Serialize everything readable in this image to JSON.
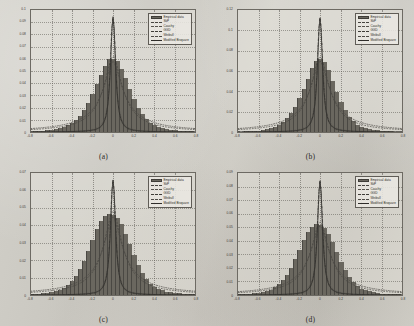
{
  "figure": {
    "background_color": "#cfcdc6",
    "panel_count": 4,
    "legend_entries": [
      {
        "label": "Empirical data",
        "style": "filled-bar",
        "color": "#6a675f"
      },
      {
        "label": "SkP",
        "style": "dashed",
        "color": "#46443f"
      },
      {
        "label": "Cauchy",
        "style": "dash-dot",
        "color": "#55524c"
      },
      {
        "label": "GGD",
        "style": "dash-dot-dot",
        "color": "#3e3c37"
      },
      {
        "label": "Weibull",
        "style": "dash-dot-dash",
        "color": "#4d4a45"
      },
      {
        "label": "Modified Bisquare",
        "style": "solid",
        "color": "#2f2d2a"
      }
    ]
  },
  "panels": [
    {
      "caption": "(a)",
      "chart_data": {
        "type": "bar",
        "title": "",
        "xlabel": "",
        "ylabel": "",
        "grid": true,
        "legend_position": "top-right",
        "xlim": [
          -0.8,
          0.8
        ],
        "ylim": [
          0,
          0.1
        ],
        "xticks": [
          "-0.8",
          "-0.6",
          "-0.4",
          "-0.2",
          "0",
          "0.2",
          "0.4",
          "0.6",
          "0.8"
        ],
        "yticks": [
          "0",
          "0.01",
          "0.02",
          "0.03",
          "0.04",
          "0.05",
          "0.06",
          "0.07",
          "0.08",
          "0.09",
          "0.1"
        ],
        "categories": [
          -0.8,
          -0.76,
          -0.72,
          -0.68,
          -0.64,
          -0.6,
          -0.56,
          -0.52,
          -0.48,
          -0.44,
          -0.4,
          -0.36,
          -0.32,
          -0.28,
          -0.24,
          -0.2,
          -0.16,
          -0.12,
          -0.08,
          -0.04,
          0.0,
          0.04,
          0.08,
          0.12,
          0.16,
          0.2,
          0.24,
          0.28,
          0.32,
          0.36,
          0.4,
          0.44,
          0.48,
          0.52,
          0.56,
          0.6,
          0.64,
          0.68,
          0.72,
          0.76,
          0.8
        ],
        "values": [
          0.0004,
          0.0006,
          0.0008,
          0.001,
          0.0013,
          0.0017,
          0.0022,
          0.003,
          0.004,
          0.0055,
          0.0075,
          0.01,
          0.0135,
          0.018,
          0.024,
          0.031,
          0.039,
          0.047,
          0.0545,
          0.0595,
          0.06,
          0.058,
          0.052,
          0.044,
          0.035,
          0.027,
          0.02,
          0.0145,
          0.0105,
          0.0075,
          0.0055,
          0.004,
          0.003,
          0.0022,
          0.0017,
          0.0013,
          0.001,
          0.0008,
          0.0006,
          0.0005,
          0.0004
        ],
        "series": [
          {
            "name": "Empirical data",
            "peak": 0.06,
            "peak_x": 0.0
          },
          {
            "name": "SkP",
            "peak": 0.062,
            "peak_x": 0.0
          },
          {
            "name": "Cauchy",
            "peak": 0.095,
            "peak_x": 0.0
          },
          {
            "name": "GGD",
            "peak": 0.093,
            "peak_x": 0.0
          },
          {
            "name": "Weibull",
            "peak": 0.058,
            "peak_x": 0.0
          },
          {
            "name": "Modified Bisquare",
            "peak": 0.094,
            "peak_x": 0.0
          }
        ]
      }
    },
    {
      "caption": "(b)",
      "chart_data": {
        "type": "bar",
        "title": "",
        "xlabel": "",
        "ylabel": "",
        "grid": true,
        "legend_position": "top-right",
        "xlim": [
          -0.8,
          0.8
        ],
        "ylim": [
          0,
          0.12
        ],
        "xticks": [
          "-0.8",
          "-0.6",
          "-0.4",
          "-0.2",
          "0",
          "0.2",
          "0.4",
          "0.6",
          "0.8"
        ],
        "yticks": [
          "0",
          "0.02",
          "0.04",
          "0.06",
          "0.08",
          "0.1",
          "0.12"
        ],
        "categories": [
          -0.8,
          -0.76,
          -0.72,
          -0.68,
          -0.64,
          -0.6,
          -0.56,
          -0.52,
          -0.48,
          -0.44,
          -0.4,
          -0.36,
          -0.32,
          -0.28,
          -0.24,
          -0.2,
          -0.16,
          -0.12,
          -0.08,
          -0.04,
          0.0,
          0.04,
          0.08,
          0.12,
          0.16,
          0.2,
          0.24,
          0.28,
          0.32,
          0.36,
          0.4,
          0.44,
          0.48,
          0.52,
          0.56,
          0.6,
          0.64,
          0.68,
          0.72,
          0.76,
          0.8
        ],
        "values": [
          0.0003,
          0.0004,
          0.0006,
          0.0008,
          0.001,
          0.0014,
          0.0019,
          0.0026,
          0.0036,
          0.005,
          0.007,
          0.0098,
          0.0135,
          0.0185,
          0.025,
          0.033,
          0.0425,
          0.0525,
          0.0625,
          0.07,
          0.072,
          0.069,
          0.061,
          0.0505,
          0.0395,
          0.0295,
          0.0212,
          0.015,
          0.0105,
          0.0073,
          0.0052,
          0.0037,
          0.0027,
          0.002,
          0.0015,
          0.0011,
          0.0008,
          0.0006,
          0.0005,
          0.0004,
          0.0003
        ],
        "series": [
          {
            "name": "Empirical data",
            "peak": 0.072,
            "peak_x": 0.0
          },
          {
            "name": "SkP",
            "peak": 0.074,
            "peak_x": 0.0
          },
          {
            "name": "Cauchy",
            "peak": 0.113,
            "peak_x": 0.0
          },
          {
            "name": "GGD",
            "peak": 0.111,
            "peak_x": 0.0
          },
          {
            "name": "Weibull",
            "peak": 0.07,
            "peak_x": 0.0
          },
          {
            "name": "Modified Bisquare",
            "peak": 0.112,
            "peak_x": 0.0
          }
        ]
      }
    },
    {
      "caption": "(c)",
      "chart_data": {
        "type": "bar",
        "title": "",
        "xlabel": "",
        "ylabel": "",
        "grid": true,
        "legend_position": "top-right",
        "xlim": [
          -0.8,
          0.8
        ],
        "ylim": [
          0,
          0.07
        ],
        "xticks": [
          "-0.8",
          "-0.6",
          "-0.4",
          "-0.2",
          "0",
          "0.2",
          "0.4",
          "0.6",
          "0.8"
        ],
        "yticks": [
          "0",
          "0.01",
          "0.02",
          "0.03",
          "0.04",
          "0.05",
          "0.06",
          "0.07"
        ],
        "categories": [
          -0.8,
          -0.76,
          -0.72,
          -0.68,
          -0.64,
          -0.6,
          -0.56,
          -0.52,
          -0.48,
          -0.44,
          -0.4,
          -0.36,
          -0.32,
          -0.28,
          -0.24,
          -0.2,
          -0.16,
          -0.12,
          -0.08,
          -0.04,
          0.0,
          0.04,
          0.08,
          0.12,
          0.16,
          0.2,
          0.24,
          0.28,
          0.32,
          0.36,
          0.4,
          0.44,
          0.48,
          0.52,
          0.56,
          0.6,
          0.64,
          0.68,
          0.72,
          0.76,
          0.8
        ],
        "values": [
          0.0005,
          0.0006,
          0.0008,
          0.001,
          0.0013,
          0.0017,
          0.0023,
          0.0031,
          0.0042,
          0.0058,
          0.008,
          0.011,
          0.015,
          0.0198,
          0.0255,
          0.0318,
          0.0378,
          0.0425,
          0.0452,
          0.0462,
          0.046,
          0.0442,
          0.0405,
          0.0352,
          0.029,
          0.0228,
          0.0172,
          0.0126,
          0.0092,
          0.0066,
          0.0048,
          0.0035,
          0.0026,
          0.0019,
          0.0015,
          0.0012,
          0.0009,
          0.0007,
          0.0006,
          0.0005,
          0.0004
        ],
        "series": [
          {
            "name": "Empirical data",
            "peak": 0.046,
            "peak_x": 0.0
          },
          {
            "name": "SkP",
            "peak": 0.048,
            "peak_x": 0.0
          },
          {
            "name": "Cauchy",
            "peak": 0.066,
            "peak_x": 0.0
          },
          {
            "name": "GGD",
            "peak": 0.065,
            "peak_x": 0.0
          },
          {
            "name": "Weibull",
            "peak": 0.045,
            "peak_x": 0.0
          },
          {
            "name": "Modified Bisquare",
            "peak": 0.066,
            "peak_x": 0.0
          }
        ]
      }
    },
    {
      "caption": "(d)",
      "chart_data": {
        "type": "bar",
        "title": "",
        "xlabel": "",
        "ylabel": "",
        "grid": true,
        "legend_position": "top-right",
        "xlim": [
          -0.8,
          0.8
        ],
        "ylim": [
          0,
          0.09
        ],
        "xticks": [
          "-0.8",
          "-0.6",
          "-0.4",
          "-0.2",
          "0",
          "0.2",
          "0.4",
          "0.6",
          "0.8"
        ],
        "yticks": [
          "0",
          "0.01",
          "0.02",
          "0.03",
          "0.04",
          "0.05",
          "0.06",
          "0.07",
          "0.08",
          "0.09"
        ],
        "categories": [
          -0.8,
          -0.76,
          -0.72,
          -0.68,
          -0.64,
          -0.6,
          -0.56,
          -0.52,
          -0.48,
          -0.44,
          -0.4,
          -0.36,
          -0.32,
          -0.28,
          -0.24,
          -0.2,
          -0.16,
          -0.12,
          -0.08,
          -0.04,
          0.0,
          0.04,
          0.08,
          0.12,
          0.16,
          0.2,
          0.24,
          0.28,
          0.32,
          0.36,
          0.4,
          0.44,
          0.48,
          0.52,
          0.56,
          0.6,
          0.64,
          0.68,
          0.72,
          0.76,
          0.8
        ],
        "values": [
          0.0004,
          0.0005,
          0.0007,
          0.0009,
          0.0012,
          0.0016,
          0.0021,
          0.0029,
          0.004,
          0.0056,
          0.0078,
          0.0108,
          0.0148,
          0.02,
          0.0263,
          0.0333,
          0.0403,
          0.0462,
          0.0502,
          0.0522,
          0.052,
          0.0498,
          0.0452,
          0.0388,
          0.0316,
          0.0245,
          0.0182,
          0.0131,
          0.0094,
          0.0067,
          0.0048,
          0.0035,
          0.0026,
          0.0019,
          0.0015,
          0.0011,
          0.0009,
          0.0007,
          0.0005,
          0.0004,
          0.0003
        ],
        "series": [
          {
            "name": "Empirical data",
            "peak": 0.052,
            "peak_x": 0.0
          },
          {
            "name": "SkP",
            "peak": 0.054,
            "peak_x": 0.0
          },
          {
            "name": "Cauchy",
            "peak": 0.085,
            "peak_x": 0.0
          },
          {
            "name": "GGD",
            "peak": 0.083,
            "peak_x": 0.0
          },
          {
            "name": "Weibull",
            "peak": 0.051,
            "peak_x": 0.0
          },
          {
            "name": "Modified Bisquare",
            "peak": 0.084,
            "peak_x": 0.0
          }
        ]
      }
    }
  ]
}
